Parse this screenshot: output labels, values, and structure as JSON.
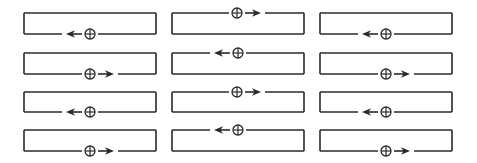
{
  "diagram": {
    "colors": {
      "stroke": "#2a2a2a",
      "background": "#ffffff"
    },
    "columns": [
      {
        "x_left": 24,
        "x_right": 156
      },
      {
        "x_left": 172,
        "x_right": 304
      },
      {
        "x_left": 320,
        "x_right": 452
      }
    ],
    "rows": [
      {
        "y_top": 13,
        "y_bottom": 34
      },
      {
        "y_top": 53,
        "y_bottom": 74
      },
      {
        "y_top": 92,
        "y_bottom": 112
      },
      {
        "y_top": 130,
        "y_bottom": 151
      }
    ],
    "symbol_glyph": "⊕",
    "cells": [
      {
        "row": 0,
        "col": 0,
        "edge": "bottom",
        "direction": "left",
        "source_x": 90
      },
      {
        "row": 0,
        "col": 1,
        "edge": "top",
        "direction": "right",
        "source_x": 237
      },
      {
        "row": 0,
        "col": 2,
        "edge": "bottom",
        "direction": "left",
        "source_x": 386
      },
      {
        "row": 1,
        "col": 0,
        "edge": "bottom",
        "direction": "right",
        "source_x": 90
      },
      {
        "row": 1,
        "col": 1,
        "edge": "top",
        "direction": "left",
        "source_x": 238
      },
      {
        "row": 1,
        "col": 2,
        "edge": "bottom",
        "direction": "right",
        "source_x": 386
      },
      {
        "row": 2,
        "col": 0,
        "edge": "bottom",
        "direction": "left",
        "source_x": 90
      },
      {
        "row": 2,
        "col": 1,
        "edge": "top",
        "direction": "right",
        "source_x": 237
      },
      {
        "row": 2,
        "col": 2,
        "edge": "bottom",
        "direction": "left",
        "source_x": 386
      },
      {
        "row": 3,
        "col": 0,
        "edge": "bottom",
        "direction": "right",
        "source_x": 90
      },
      {
        "row": 3,
        "col": 1,
        "edge": "top",
        "direction": "left",
        "source_x": 238
      },
      {
        "row": 3,
        "col": 2,
        "edge": "bottom",
        "direction": "right",
        "source_x": 386
      }
    ]
  }
}
